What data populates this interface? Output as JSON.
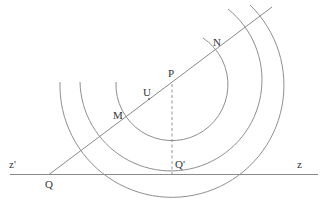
{
  "diagram": {
    "colors": {
      "line": "#8a8a8a",
      "arc": "#8f8f8f",
      "label": "#333333"
    },
    "labels": {
      "N": "N",
      "P": "P",
      "U": "U",
      "M": "M",
      "Q_prime": "Q'",
      "z_prime": "z'",
      "z": "z",
      "Q": "Q"
    },
    "elements": {
      "axis_line": "horizontal line z'z",
      "ray": "line from Q through M, U, P, N",
      "dashed_perpendicular": "dashed segment from P down to Q'",
      "arcs": [
        "inner arc through M and N",
        "middle arc tangent to z'z at Q'",
        "outer arc crossing z'z"
      ]
    }
  }
}
